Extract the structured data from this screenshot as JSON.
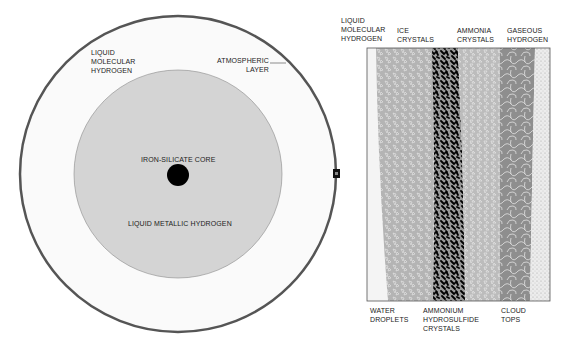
{
  "left_diagram": {
    "title": "Jupiter interior cross-section",
    "labels": {
      "liquid_molecular_hydrogen": "LIQUID\nMOLECULAR\nHYDROGEN",
      "atmospheric_layer": "ATMOSPHERIC\nLAYER",
      "core": "IRON-SILICATE CORE",
      "liquid_metallic_hydrogen": "LIQUID METALLIC HYDROGEN"
    },
    "colors": {
      "outer_ring": "#555555",
      "outer_fill": "#fafafa",
      "inner_fill": "#d4d4d4",
      "core": "#000000"
    }
  },
  "right_diagram": {
    "title": "Atmospheric layer detail",
    "top_labels": [
      "LIQUID\nMOLECULAR\nHYDROGEN",
      "ICE\nCRYSTALS",
      "AMMONIA\nCRYSTALS",
      "GASEOUS\nHYDROGEN"
    ],
    "bottom_labels": [
      "WATER\nDROPLETS",
      "AMMONIUM\nHYDROSULFIDE\nCRYSTALS",
      "CLOUD\nTOPS"
    ],
    "colors": {
      "liquid_band": "#f4f4f4",
      "ice_band": "#b4b4b4",
      "hydrosulfide_band": "#1a1a1a",
      "ammonia_band": "#bcbcbc",
      "cloud_band": "#8e8e8e",
      "gas_band": "#e6e6e6"
    }
  }
}
